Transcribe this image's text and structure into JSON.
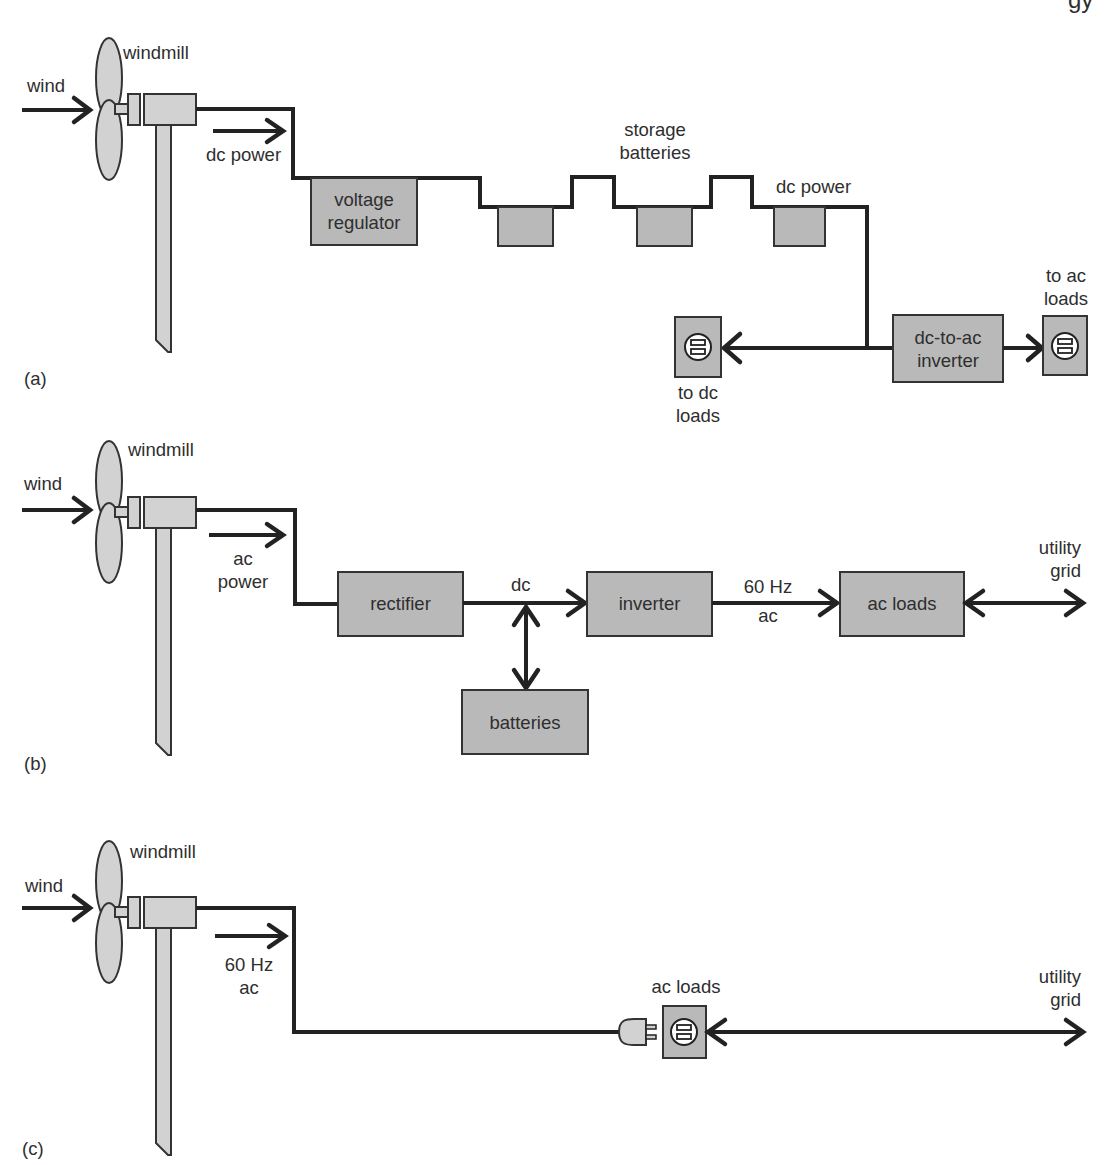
{
  "page_header_fragment": "gy",
  "diagrams": [
    {
      "id": "a",
      "panel_label": "(a)",
      "title_labels": {
        "windmill": "windmill",
        "wind": "wind",
        "power_type": "dc power"
      },
      "components": {
        "voltage_regulator": [
          "voltage",
          "regulator"
        ],
        "storage_batteries": [
          "storage",
          "batteries"
        ],
        "dc_power_out": "dc power",
        "dc_loads": [
          "to dc",
          "loads"
        ],
        "inverter": [
          "dc-to-ac",
          "inverter"
        ],
        "ac_loads": [
          "to ac",
          "loads"
        ]
      }
    },
    {
      "id": "b",
      "panel_label": "(b)",
      "title_labels": {
        "windmill": "windmill",
        "wind": "wind",
        "power_type": [
          "ac",
          "power"
        ]
      },
      "components": {
        "rectifier": "rectifier",
        "dc_label": "dc",
        "inverter": "inverter",
        "hz_label": [
          "60 Hz",
          "ac"
        ],
        "ac_loads": "ac loads",
        "batteries": "batteries",
        "utility_grid": [
          "utility",
          "grid"
        ]
      }
    },
    {
      "id": "c",
      "panel_label": "(c)",
      "title_labels": {
        "windmill": "windmill",
        "wind": "wind",
        "power_type": [
          "60 Hz",
          "ac"
        ]
      },
      "components": {
        "ac_loads": "ac loads",
        "utility_grid": [
          "utility",
          "grid"
        ]
      }
    }
  ],
  "colors": {
    "box_fill": "#b9b9b9",
    "windmill_fill": "#d2d2d2",
    "line": "#222222"
  }
}
